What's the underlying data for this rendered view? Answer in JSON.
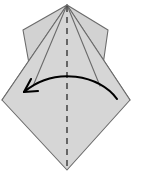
{
  "diagram": {
    "title": "Origami fold step diagram",
    "description": "Kite-shaped folded paper with two upper side flaps, a dashed vertical center crease, and a curved arrow indicating a right-to-left fold.",
    "canvas": {
      "width": 141,
      "height": 175
    },
    "colors": {
      "background": "#ffffff",
      "paper_fill": "#d6d6d6",
      "flap_fill": "#d2d2d2",
      "paper_stroke": "#6b6b6b",
      "crease_line": "#4a4a4a",
      "arrow": "#000000"
    },
    "shapes": {
      "main_body": {
        "name": "main-diamond",
        "points": "67,5 130,100 67,170 2,100"
      },
      "left_flap": {
        "name": "left-flap",
        "points": "67,5 23,30 34,58"
      },
      "left_flap_outer": {
        "name": "left-flap-outer",
        "points": "67,5 23,30 33,86 2,100"
      },
      "right_flap": {
        "name": "right-flap",
        "points": "67,5 108,30 99,58"
      },
      "right_flap_outer": {
        "name": "right-flap-outer",
        "points": "67,5 108,30 100,86 130,100"
      },
      "crease_fold_left": {
        "name": "fold-edge-left",
        "path": "M 67 5 L 33 86"
      },
      "crease_fold_right": {
        "name": "fold-edge-right",
        "path": "M 67 5 L 100 86"
      }
    },
    "center_crease": {
      "name": "center-crease-line",
      "label": "valley fold center line",
      "x": 67,
      "y_top": 6,
      "y_bottom": 170,
      "dash_pattern": "6 5",
      "width": 1.6
    },
    "fold_arrow": {
      "name": "fold-direction-arrow",
      "label": "fold right half over to the left",
      "direction": "right-to-left",
      "path": "M 117 99 C 100 75, 55 66, 24 92",
      "head_left": "M 24 92 L 38 91",
      "head_right": "M 24 92 L 31 79",
      "stroke_width": 2.1
    }
  }
}
